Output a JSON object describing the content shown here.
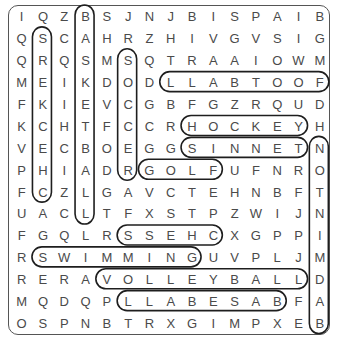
{
  "puzzle": {
    "rows": [
      [
        "I",
        "Q",
        "Z",
        "B",
        "S",
        "J",
        "N",
        "J",
        "B",
        "I",
        "S",
        "P",
        "A",
        "I",
        "B"
      ],
      [
        "Q",
        "S",
        "C",
        "A",
        "H",
        "R",
        "Z",
        "H",
        "I",
        "V",
        "G",
        "V",
        "S",
        "I",
        "G"
      ],
      [
        "Q",
        "R",
        "Q",
        "S",
        "M",
        "S",
        "Q",
        "T",
        "R",
        "A",
        "A",
        "I",
        "O",
        "W",
        "M"
      ],
      [
        "M",
        "E",
        "I",
        "K",
        "D",
        "O",
        "D",
        "L",
        "L",
        "A",
        "B",
        "T",
        "O",
        "O",
        "F"
      ],
      [
        "F",
        "K",
        "I",
        "E",
        "V",
        "C",
        "G",
        "B",
        "F",
        "G",
        "Z",
        "R",
        "Q",
        "U",
        "D"
      ],
      [
        "K",
        "C",
        "H",
        "T",
        "F",
        "C",
        "C",
        "R",
        "H",
        "O",
        "C",
        "K",
        "E",
        "Y",
        "H"
      ],
      [
        "V",
        "E",
        "C",
        "B",
        "O",
        "E",
        "G",
        "G",
        "S",
        "I",
        "N",
        "N",
        "E",
        "T",
        "N"
      ],
      [
        "P",
        "H",
        "I",
        "A",
        "D",
        "R",
        "G",
        "O",
        "L",
        "F",
        "U",
        "F",
        "N",
        "R",
        "O"
      ],
      [
        "F",
        "C",
        "Z",
        "L",
        "G",
        "A",
        "V",
        "C",
        "T",
        "E",
        "H",
        "N",
        "B",
        "F",
        "T"
      ],
      [
        "U",
        "A",
        "C",
        "L",
        "T",
        "F",
        "X",
        "S",
        "T",
        "P",
        "Z",
        "W",
        "I",
        "J",
        "N"
      ],
      [
        "F",
        "G",
        "Q",
        "L",
        "R",
        "S",
        "S",
        "E",
        "H",
        "C",
        "X",
        "G",
        "P",
        "P",
        "I"
      ],
      [
        "R",
        "S",
        "W",
        "I",
        "M",
        "M",
        "I",
        "N",
        "G",
        "U",
        "V",
        "P",
        "L",
        "J",
        "M"
      ],
      [
        "R",
        "E",
        "R",
        "A",
        "V",
        "O",
        "L",
        "L",
        "E",
        "Y",
        "B",
        "A",
        "L",
        "L",
        "D"
      ],
      [
        "M",
        "Q",
        "D",
        "Q",
        "P",
        "L",
        "L",
        "A",
        "B",
        "E",
        "S",
        "A",
        "B",
        "F",
        "A"
      ],
      [
        "O",
        "S",
        "P",
        "N",
        "B",
        "T",
        "R",
        "X",
        "G",
        "I",
        "M",
        "P",
        "X",
        "E",
        "B"
      ]
    ],
    "found_words": [
      {
        "word": "BASKETBALL",
        "orientation": "vertical",
        "col": 3,
        "row_start": 0,
        "row_end": 9
      },
      {
        "word": "CHECKERS",
        "orientation": "vertical",
        "col": 1,
        "row_start": 1,
        "row_end": 8
      },
      {
        "word": "SOCCER",
        "orientation": "vertical",
        "col": 5,
        "row_start": 2,
        "row_end": 7
      },
      {
        "word": "FOOTBALL",
        "orientation": "horizontal",
        "row": 3,
        "col_start": 7,
        "col_end": 14
      },
      {
        "word": "HOCKEY",
        "orientation": "horizontal",
        "row": 5,
        "col_start": 8,
        "col_end": 13
      },
      {
        "word": "TENNIS",
        "orientation": "horizontal",
        "row": 6,
        "col_start": 8,
        "col_end": 13
      },
      {
        "word": "BADMINTON",
        "orientation": "vertical",
        "col": 14,
        "row_start": 6,
        "row_end": 14
      },
      {
        "word": "GOLF",
        "orientation": "horizontal",
        "row": 7,
        "col_start": 6,
        "col_end": 9
      },
      {
        "word": "CHESS",
        "orientation": "horizontal",
        "row": 10,
        "col_start": 5,
        "col_end": 9
      },
      {
        "word": "SWIMMING",
        "orientation": "horizontal",
        "row": 11,
        "col_start": 1,
        "col_end": 8
      },
      {
        "word": "VOLLEYBALL",
        "orientation": "horizontal",
        "row": 12,
        "col_start": 4,
        "col_end": 13
      },
      {
        "word": "BASEBALL",
        "orientation": "horizontal",
        "row": 13,
        "col_start": 5,
        "col_end": 12
      }
    ]
  }
}
